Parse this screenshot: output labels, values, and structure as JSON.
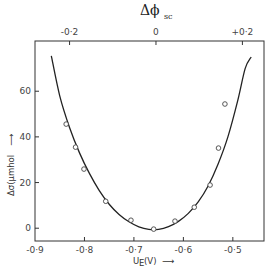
{
  "chart_data": {
    "type": "scatter",
    "title": "",
    "top_axis": {
      "label_main": "Δϕ",
      "label_sub": "sc",
      "ticks": [
        -0.2,
        0,
        0.2
      ],
      "tick_labels": [
        "-0·2",
        "0",
        "+0·2"
      ],
      "range": [
        -0.28,
        0.25
      ]
    },
    "xlabel": "U",
    "xlabel_sub": "E",
    "xlabel_unit": "(V)",
    "xlabel_arrow": "⟶",
    "ylabel": "Δσ(μmhol",
    "ylabel_arrow": "⟶",
    "xlim": [
      -0.9,
      -0.437
    ],
    "ylim": [
      -5.6,
      82
    ],
    "xticks": [
      -0.9,
      -0.8,
      -0.7,
      -0.6,
      -0.5
    ],
    "xtick_labels": [
      "-0·9",
      "-0·8",
      "-0·7",
      "-0·6",
      "-0·5"
    ],
    "yticks": [
      0,
      20,
      40,
      60
    ],
    "ytick_labels": [
      "0",
      "20",
      "40",
      "60"
    ],
    "grid": false,
    "series": [
      {
        "name": "measured",
        "marker": "open-circle",
        "x": [
          -0.837,
          -0.818,
          -0.801,
          -0.757,
          -0.706,
          -0.66,
          -0.617,
          -0.578,
          -0.546,
          -0.529,
          -0.516
        ],
        "y": [
          45.6,
          35.5,
          25.9,
          11.8,
          3.5,
          -0.4,
          3.1,
          9.2,
          18.9,
          35.1,
          54.4
        ]
      },
      {
        "name": "fit",
        "style": "line",
        "x": [
          -0.867,
          -0.85,
          -0.83,
          -0.81,
          -0.79,
          -0.77,
          -0.75,
          -0.73,
          -0.71,
          -0.69,
          -0.67,
          -0.65,
          -0.63,
          -0.61,
          -0.59,
          -0.57,
          -0.55,
          -0.53,
          -0.51,
          -0.49,
          -0.475,
          -0.463
        ],
        "y": [
          75.5,
          58,
          44,
          33,
          24,
          16.5,
          10.5,
          6,
          2.8,
          0.6,
          -0.5,
          -0.5,
          0.7,
          3,
          6.5,
          11.5,
          18.5,
          28,
          40,
          56,
          70,
          75
        ]
      }
    ]
  }
}
